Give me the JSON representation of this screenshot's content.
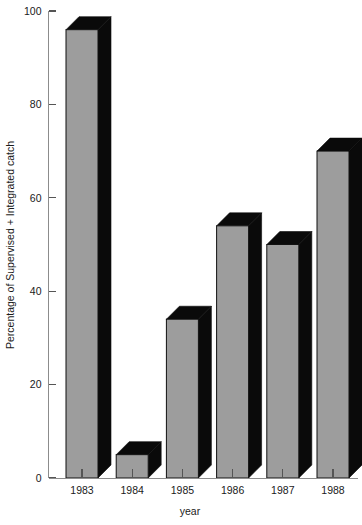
{
  "chart_data": {
    "type": "bar",
    "title": "",
    "xlabel": "year",
    "ylabel": "Percentage of Supervised + Integrated catch",
    "categories": [
      "1983",
      "1984",
      "1985",
      "1986",
      "1987",
      "1988"
    ],
    "values": [
      96,
      5,
      34,
      54,
      50,
      70
    ],
    "ylim": [
      0,
      100
    ],
    "yticks": [
      0,
      20,
      40,
      60,
      80,
      100
    ],
    "ytick_labels": [
      "0",
      "20",
      "40",
      "60",
      "80",
      "100"
    ],
    "grid": false,
    "legend": false,
    "style": {
      "bar_face_color": "#9d9d9d",
      "bar_shadow_color": "#0a0a0a",
      "axis_color": "#8c8c8c",
      "background": "#ffffff",
      "three_d": true
    }
  }
}
